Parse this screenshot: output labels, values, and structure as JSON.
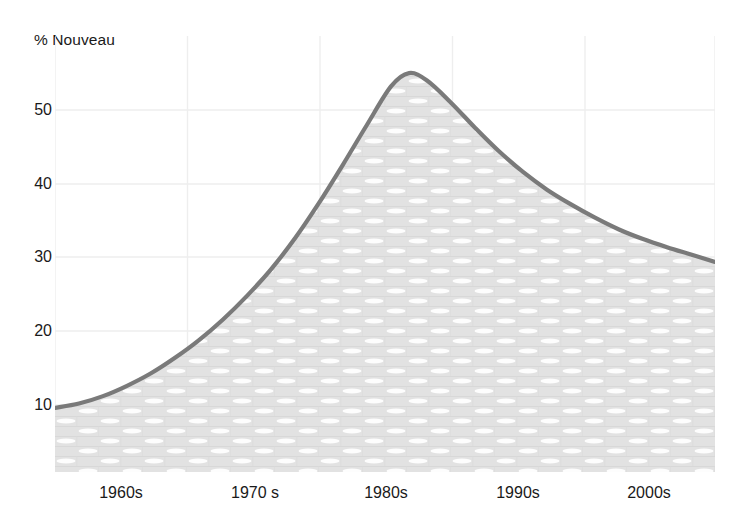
{
  "chart_data": {
    "type": "area",
    "title": "% Nouveau",
    "xlabel": "",
    "ylabel": "% Nouveau",
    "grid": true,
    "legend": false,
    "xlim": [
      1955,
      2010
    ],
    "ylim": [
      0,
      60
    ],
    "ytick_labels": [
      "10",
      "20",
      "30",
      "40",
      "50"
    ],
    "ytick_values": [
      10,
      20,
      30,
      40,
      50
    ],
    "xtick_labels": [
      "1960s",
      "1970 s",
      "1980s",
      "1990s",
      "2000s"
    ],
    "xtick_values": [
      1960,
      1970,
      1980,
      1990,
      2000
    ],
    "series": [
      {
        "name": "% Nouveau",
        "line_color": "#7a7a7a",
        "fill_color": "#e2e2e2",
        "x": [
          1955,
          1957,
          1959,
          1961,
          1963,
          1965,
          1967,
          1969,
          1971,
          1973,
          1975,
          1977,
          1979,
          1981,
          1983,
          1984.5,
          1986,
          1988,
          1990,
          1992,
          1994,
          1996,
          1998,
          2000,
          2002,
          2004,
          2006,
          2008,
          2010
        ],
        "values": [
          9.6,
          10.2,
          11.2,
          12.6,
          14.3,
          16.4,
          18.8,
          21.6,
          24.8,
          28.4,
          32.6,
          37.4,
          42.6,
          48.0,
          53.2,
          55.0,
          54.0,
          51.0,
          47.6,
          44.4,
          41.6,
          39.2,
          37.2,
          35.4,
          33.8,
          32.5,
          31.4,
          30.4,
          29.4
        ]
      }
    ],
    "peak": {
      "x": 1984.5,
      "value": 55.0
    },
    "start_value": 9.6,
    "end_value": 29.4
  },
  "axes": {
    "y_labels": [
      {
        "text": "50",
        "top": 110
      },
      {
        "text": "40",
        "top": 184
      },
      {
        "text": "30",
        "top": 257
      },
      {
        "text": "20",
        "top": 331
      },
      {
        "text": "10",
        "top": 405
      }
    ],
    "x_labels": [
      {
        "text": "1960s",
        "left": 121
      },
      {
        "text": "1970 s",
        "left": 255
      },
      {
        "text": "1980s",
        "left": 386
      },
      {
        "text": "1990s",
        "left": 518
      },
      {
        "text": "2000s",
        "left": 649
      }
    ],
    "gridlines_x": [
      0,
      132.5,
      265,
      397.5,
      530,
      660
    ],
    "gridlines_y": [
      74,
      148,
      221,
      295,
      369
    ]
  },
  "colors": {
    "line": "#7a7a7a",
    "fill": "#e2e2e2",
    "grid": "#eeeeee",
    "text": "#1a1a1a",
    "background": "#ffffff",
    "texture_light": "#fefefe"
  }
}
